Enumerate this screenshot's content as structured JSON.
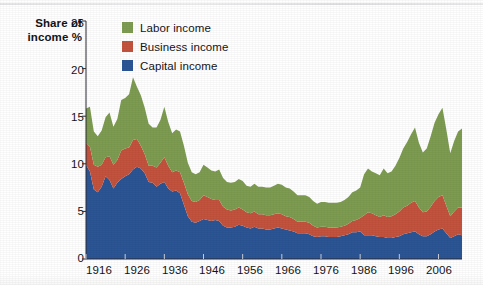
{
  "axis_title": {
    "line1": "Share of",
    "line2": "income %"
  },
  "legend": {
    "position": "top-left-inside",
    "items": [
      {
        "label": "Labor income",
        "color": "#7d9c50"
      },
      {
        "label": "Business income",
        "color": "#c4523c"
      },
      {
        "label": "Capital income",
        "color": "#2b5596"
      }
    ]
  },
  "yticks": [
    "0",
    "5",
    "10",
    "15",
    "20",
    "25"
  ],
  "xticks": [
    "1916",
    "1926",
    "1936",
    "1946",
    "1956",
    "1966",
    "1976",
    "1986",
    "1996",
    "2006"
  ],
  "chart_data": {
    "type": "area",
    "stacked": true,
    "title": "",
    "subtitle": "",
    "xlabel": "",
    "ylabel": "Share of income %",
    "xlim": [
      1916,
      2012
    ],
    "ylim": [
      0,
      25
    ],
    "yticks": [
      0,
      5,
      10,
      15,
      20,
      25
    ],
    "xticks": [
      1916,
      1926,
      1936,
      1946,
      1956,
      1966,
      1976,
      1986,
      1996,
      2006
    ],
    "grid": false,
    "legend_entries": [
      "Labor income",
      "Business income",
      "Capital income"
    ],
    "stack_order_bottom_to_top": [
      "Capital income",
      "Business income",
      "Labor income"
    ],
    "colors": {
      "Labor income": "#7d9c50",
      "Business income": "#c4523c",
      "Capital income": "#2b5596"
    },
    "x": [
      1916,
      1917,
      1918,
      1919,
      1920,
      1921,
      1922,
      1923,
      1924,
      1925,
      1926,
      1927,
      1928,
      1929,
      1930,
      1931,
      1932,
      1933,
      1934,
      1935,
      1936,
      1937,
      1938,
      1939,
      1940,
      1941,
      1942,
      1943,
      1944,
      1945,
      1946,
      1947,
      1948,
      1949,
      1950,
      1951,
      1952,
      1953,
      1954,
      1955,
      1956,
      1957,
      1958,
      1959,
      1960,
      1961,
      1962,
      1963,
      1964,
      1965,
      1966,
      1967,
      1968,
      1969,
      1970,
      1971,
      1972,
      1973,
      1974,
      1975,
      1976,
      1977,
      1978,
      1979,
      1980,
      1981,
      1982,
      1983,
      1984,
      1985,
      1986,
      1987,
      1988,
      1989,
      1990,
      1991,
      1992,
      1993,
      1994,
      1995,
      1996,
      1997,
      1998,
      1999,
      2000,
      2001,
      2002,
      2003,
      2004,
      2005,
      2006,
      2007,
      2008,
      2009,
      2010,
      2011,
      2012
    ],
    "series": [
      {
        "name": "Capital income",
        "values": [
          9.9,
          9.2,
          7.3,
          7.0,
          7.6,
          8.7,
          8.3,
          7.4,
          8.0,
          8.4,
          8.7,
          8.9,
          9.4,
          9.7,
          9.5,
          9.0,
          8.1,
          8.0,
          7.6,
          7.9,
          8.1,
          7.4,
          7.1,
          7.2,
          6.9,
          5.7,
          4.5,
          3.9,
          3.8,
          4.0,
          4.2,
          4.1,
          4.0,
          4.1,
          4.0,
          3.5,
          3.3,
          3.3,
          3.4,
          3.6,
          3.5,
          3.3,
          3.2,
          3.4,
          3.2,
          3.2,
          3.1,
          3.1,
          3.2,
          3.3,
          3.2,
          3.1,
          3.0,
          2.9,
          2.7,
          2.7,
          2.7,
          2.6,
          2.4,
          2.3,
          2.4,
          2.4,
          2.3,
          2.3,
          2.3,
          2.4,
          2.5,
          2.6,
          2.8,
          2.8,
          2.9,
          2.5,
          2.5,
          2.5,
          2.4,
          2.3,
          2.3,
          2.2,
          2.2,
          2.3,
          2.4,
          2.6,
          2.7,
          2.8,
          2.9,
          2.6,
          2.4,
          2.4,
          2.6,
          2.9,
          3.1,
          3.2,
          2.7,
          2.2,
          2.4,
          2.6,
          2.5
        ]
      },
      {
        "name": "Business income",
        "values": [
          2.3,
          2.6,
          2.6,
          2.7,
          2.3,
          2.0,
          2.5,
          2.5,
          2.4,
          3.0,
          2.9,
          2.8,
          3.1,
          2.9,
          2.4,
          2.0,
          1.7,
          1.8,
          2.0,
          2.2,
          2.6,
          2.4,
          2.0,
          2.1,
          2.2,
          2.3,
          2.3,
          2.2,
          2.2,
          2.2,
          2.5,
          2.4,
          2.3,
          2.1,
          2.2,
          2.0,
          1.9,
          1.8,
          1.8,
          1.8,
          1.7,
          1.6,
          1.6,
          1.6,
          1.5,
          1.5,
          1.5,
          1.5,
          1.5,
          1.5,
          1.5,
          1.4,
          1.4,
          1.3,
          1.2,
          1.2,
          1.2,
          1.2,
          1.1,
          1.0,
          1.0,
          1.0,
          1.0,
          1.0,
          1.0,
          1.0,
          1.0,
          1.1,
          1.2,
          1.3,
          1.4,
          2.1,
          2.4,
          2.3,
          2.2,
          2.1,
          2.3,
          2.2,
          2.3,
          2.4,
          2.6,
          2.8,
          2.9,
          3.1,
          3.2,
          2.8,
          2.5,
          2.6,
          2.9,
          3.2,
          3.4,
          3.5,
          2.9,
          2.3,
          2.6,
          2.8,
          2.9
        ]
      },
      {
        "name": "Labor income",
        "values": [
          3.6,
          4.2,
          3.5,
          3.2,
          3.6,
          4.2,
          4.6,
          4.0,
          4.3,
          5.3,
          5.3,
          5.6,
          6.6,
          5.5,
          5.3,
          4.9,
          4.4,
          4.0,
          4.2,
          4.5,
          5.3,
          4.6,
          4.1,
          4.3,
          4.3,
          3.9,
          3.3,
          3.0,
          2.9,
          2.9,
          3.2,
          3.1,
          3.0,
          3.0,
          3.2,
          3.0,
          2.9,
          2.9,
          2.9,
          3.0,
          3.0,
          2.8,
          2.8,
          2.9,
          2.9,
          2.9,
          2.9,
          2.9,
          3.0,
          3.1,
          3.1,
          3.0,
          3.0,
          2.9,
          2.8,
          2.8,
          2.8,
          2.7,
          2.6,
          2.5,
          2.6,
          2.6,
          2.6,
          2.6,
          2.6,
          2.6,
          2.7,
          2.8,
          3.0,
          3.1,
          3.2,
          4.3,
          4.6,
          4.4,
          4.4,
          4.4,
          4.9,
          4.6,
          4.7,
          5.1,
          5.6,
          6.2,
          6.7,
          7.2,
          7.7,
          6.8,
          6.3,
          6.6,
          7.4,
          8.2,
          8.7,
          9.2,
          8.0,
          6.6,
          7.4,
          8.0,
          8.3
        ]
      }
    ]
  }
}
